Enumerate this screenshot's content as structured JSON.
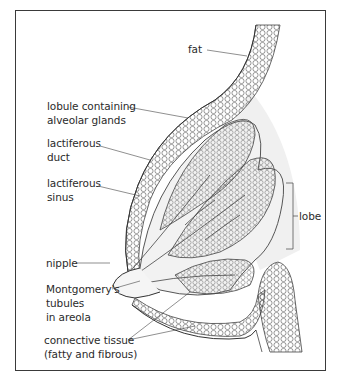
{
  "diagram": {
    "labels": {
      "fat": "fat",
      "lobule_line1": "lobule containing",
      "lobule_line2": "alveolar glands",
      "duct_line1": "lactiferous",
      "duct_line2": "duct",
      "sinus_line1": "lactiferous",
      "sinus_line2": "sinus",
      "lobe": "lobe",
      "nipple": "nipple",
      "montgomery_line1": "Montgomery's",
      "montgomery_line2": "tubules",
      "montgomery_line3": "in areola",
      "connective_line1": "connective tissue",
      "connective_line2": "(fatty and fibrous)"
    },
    "colors": {
      "line": "#3a3a3a",
      "shading": "#eeeeee",
      "frame": "#3a3a3a"
    }
  }
}
